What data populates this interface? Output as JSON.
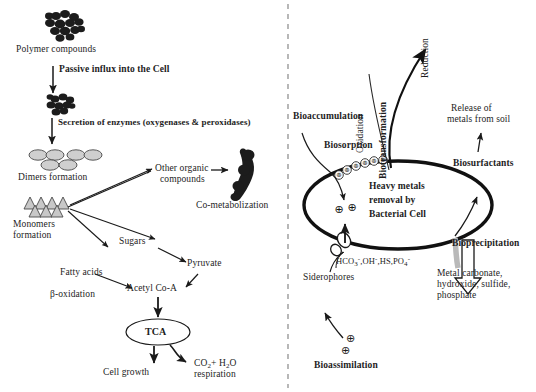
{
  "figure": {
    "panels": [
      "biodegradation-pathway",
      "heavy-metal-removal"
    ],
    "divider": "vertical-dashed-line"
  },
  "left_panel": {
    "polymer_label": "Polymer compounds",
    "passive_influx": "Passive influx into the Cell",
    "secretion": "Secretion of enzymes (oxygenases & peroxidases)",
    "dimers": "Dimers formation",
    "monomers_line1": "Monomers",
    "monomers_line2": "formation",
    "other_organic_line1": "Other organic",
    "other_organic_line2": "compounds",
    "co_metabolization": "Co-metabolization",
    "sugars": "Sugars",
    "pyruvate": "Pyruvate",
    "fatty_acids": "Fatty acids",
    "beta_oxidation": "β-oxidation",
    "acetyl_coa": "Acetyl Co-A",
    "tca": "TCA",
    "cell_growth": "Cell growth",
    "co2_h2o_line1": "CO2+ H2O",
    "co2_h2o_line2": "respiration"
  },
  "right_panel": {
    "bioaccumulation": "Bioaccumulation",
    "biosorption": "Biosorption",
    "oxidation": "Oxidation",
    "biotransformation": "Biotransformation",
    "reduction": "Reduction",
    "release_line1": "Release of",
    "release_line2": "metals from soil",
    "biosurfactants": "Biosurfactants",
    "cell_line1": "Heavy metals",
    "cell_line2": "removal by",
    "cell_line3": "Bacterial Cell",
    "ligands": "HCO3-, OH-, HS, PO4-",
    "siderophores": "Siderophores",
    "bioprecipitation": "Bioprecipitation",
    "products_line1": "Metal carbonate,",
    "products_line2": "hydroxide, sulfide,",
    "products_line3": "phosphate",
    "bioassimilation": "Bioassimilation",
    "charge_symbol": "⊕"
  },
  "colors": {
    "ink": "#1a1a1a",
    "dimer_fill": "#cfcfcf",
    "monomer_fill": "#c8c8c8",
    "polymer_fill": "#1c1c1c",
    "precip_arrow_fill": "#b9b9b9"
  }
}
